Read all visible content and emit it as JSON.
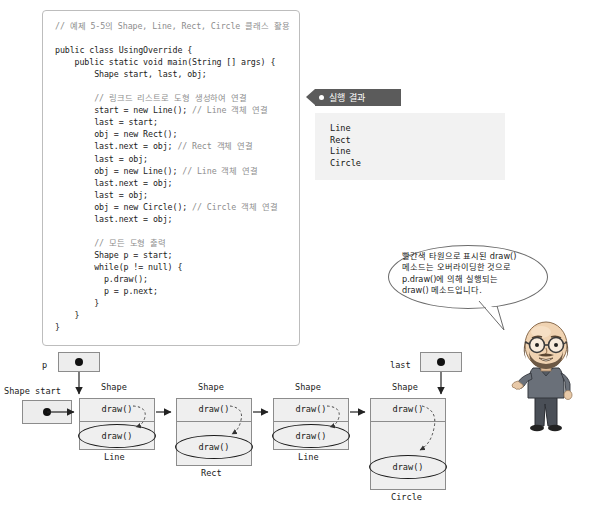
{
  "code_panel": {
    "name": "java-source-listing",
    "lines": [
      {
        "t": "// 예제 5-5의 Shape, Line, Rect, Circle 클래스 활용",
        "c": true
      },
      {
        "t": "",
        "c": false
      },
      {
        "t": "public class UsingOverride {",
        "c": false
      },
      {
        "t": "    public static void main(String [] args) {",
        "c": false
      },
      {
        "t": "        Shape start, last, obj;",
        "c": false
      },
      {
        "t": "",
        "c": false
      },
      {
        "t": "        // 링크드 리스트로 도형 생성하여 연결",
        "c": true
      },
      {
        "t": "        start = new Line(); // Line 객체 연결",
        "c": false
      },
      {
        "t": "        last = start;",
        "c": false
      },
      {
        "t": "        obj = new Rect();",
        "c": false
      },
      {
        "t": "        last.next = obj; // Rect 객체 연결",
        "c": false
      },
      {
        "t": "        last = obj;",
        "c": false
      },
      {
        "t": "        obj = new Line(); // Line 객체 연결",
        "c": false
      },
      {
        "t": "        last.next = obj;",
        "c": false
      },
      {
        "t": "        last = obj;",
        "c": false
      },
      {
        "t": "        obj = new Circle(); // Circle 객체 연결",
        "c": false
      },
      {
        "t": "        last.next = obj;",
        "c": false
      },
      {
        "t": "",
        "c": false
      },
      {
        "t": "        // 모든 도형 출력",
        "c": true
      },
      {
        "t": "        Shape p = start;",
        "c": false
      },
      {
        "t": "        while(p != null) {",
        "c": false
      },
      {
        "t": "          p.draw();",
        "c": false
      },
      {
        "t": "          p = p.next;",
        "c": false
      },
      {
        "t": "        }",
        "c": false
      },
      {
        "t": "    }",
        "c": false
      },
      {
        "t": "}",
        "c": false
      }
    ]
  },
  "result": {
    "tag_label": "실행 결과",
    "output": "Line\nRect\nLine\nCircle"
  },
  "annotation": {
    "bubble_text": "빨간색 타원으로 표시된 draw()\n메소드는 오버라이딩한 것으로\np.draw()에  의해  실행되는\ndraw() 메소드입니다."
  },
  "diagram": {
    "p_var_label": "p",
    "last_var_label": "last",
    "start_var_label": "Shape start",
    "nodes": [
      {
        "class_label": "Shape",
        "method_top": "draw()",
        "method_ellipse": "draw()",
        "type_label": "Line"
      },
      {
        "class_label": "Shape",
        "method_top": "draw()",
        "method_ellipse": "draw()",
        "type_label": "Rect"
      },
      {
        "class_label": "Shape",
        "method_top": "draw()",
        "method_ellipse": "draw()",
        "type_label": "Line"
      },
      {
        "class_label": "Shape",
        "method_top": "draw()",
        "method_ellipse": "draw()",
        "type_label": "Circle"
      }
    ]
  },
  "colors": {
    "tag_bg": "#5b5b5b",
    "result_bg": "#f2f2f2",
    "box_bg": "#efefef",
    "box_border": "#8c8c8c",
    "code_border": "#bdbdbd",
    "comment": "#8d8d8d"
  }
}
